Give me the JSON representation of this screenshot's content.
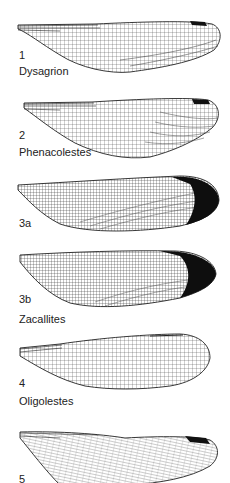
{
  "figure": {
    "type": "fossil wing venation plate",
    "panels": [
      {
        "number": "1",
        "genus": "Dysagrion",
        "apical_dark": "small"
      },
      {
        "number": "2",
        "genus": "Phenacolestes",
        "apical_dark": "small"
      },
      {
        "number": "3a",
        "genus": "",
        "apical_dark": "large"
      },
      {
        "number": "3b",
        "genus": "Zacallites",
        "apical_dark": "large"
      },
      {
        "number": "4",
        "genus": "Oligolestes",
        "apical_dark": "none"
      },
      {
        "number": "5",
        "genus": "",
        "apical_dark": "small"
      }
    ],
    "colors": {
      "background": "#ffffff",
      "ink": "#1a1a1a",
      "vein": "#333333"
    }
  }
}
